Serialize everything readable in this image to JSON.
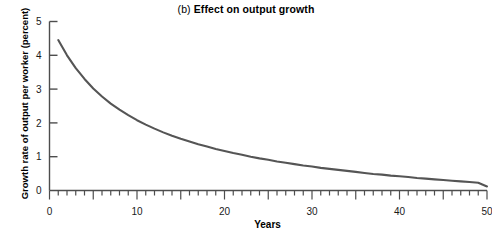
{
  "chart_data": {
    "type": "line",
    "title": "(b) Effect on output growth",
    "title_prefix": "(b) ",
    "title_main": "Effect on output growth",
    "xlabel": "Years",
    "ylabel": "Growth rate of output per worker (percent)",
    "xlim": [
      0,
      50
    ],
    "ylim": [
      0,
      5
    ],
    "xticks": [
      0,
      10,
      20,
      30,
      40,
      50
    ],
    "xtick_labels": [
      "0",
      "10",
      "20",
      "30",
      "40",
      "50"
    ],
    "x_major_tick_interval": 5,
    "x_minor_tick_interval": 1,
    "yticks": [
      0,
      1,
      2,
      3,
      4,
      5
    ],
    "ytick_labels": [
      "0",
      "1",
      "2",
      "3",
      "4",
      "5"
    ],
    "grid": false,
    "legend": false,
    "line_color": "#555555",
    "axis_color": "#4d4d4d",
    "series": [
      {
        "name": "Growth rate of output per worker",
        "x": [
          1,
          2,
          3,
          4,
          5,
          6,
          7,
          8,
          9,
          10,
          11,
          12,
          13,
          14,
          15,
          16,
          17,
          18,
          19,
          20,
          21,
          22,
          23,
          24,
          25,
          26,
          27,
          28,
          29,
          30,
          31,
          32,
          33,
          34,
          35,
          36,
          37,
          38,
          39,
          40,
          41,
          42,
          43,
          44,
          45,
          46,
          47,
          48,
          49,
          50
        ],
        "values": [
          4.45,
          4.0,
          3.62,
          3.3,
          3.02,
          2.78,
          2.57,
          2.39,
          2.23,
          2.08,
          1.95,
          1.83,
          1.72,
          1.62,
          1.53,
          1.45,
          1.37,
          1.3,
          1.23,
          1.17,
          1.11,
          1.06,
          1.0,
          0.95,
          0.91,
          0.86,
          0.82,
          0.78,
          0.74,
          0.71,
          0.67,
          0.64,
          0.61,
          0.58,
          0.55,
          0.52,
          0.49,
          0.47,
          0.44,
          0.42,
          0.4,
          0.37,
          0.35,
          0.33,
          0.31,
          0.29,
          0.27,
          0.25,
          0.23,
          0.12
        ]
      }
    ]
  }
}
